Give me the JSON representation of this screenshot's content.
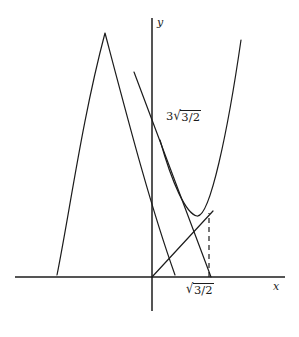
{
  "figure": {
    "background_color": "#ffffff",
    "ink_color": "#1c1c1c",
    "axes": {
      "x_axis_label": "x",
      "y_axis_label": "y",
      "x_axis": {
        "x1": 15,
        "y1": 277,
        "x2": 285,
        "y2": 277
      },
      "y_axis": {
        "x1": 152,
        "y1": 18,
        "x2": 152,
        "y2": 311
      },
      "origin": {
        "x": 152,
        "y": 277
      }
    },
    "labels": {
      "y_intercept": {
        "name": "3-root-three-halves",
        "coefficient": "3",
        "radical_sign": "√",
        "radicand": "3/2",
        "plain_text": "3√(3/2)"
      },
      "x_intercept": {
        "name": "root-three-halves",
        "coefficient": "",
        "radical_sign": "√",
        "radicand": "3/2",
        "plain_text": "√(3/2)"
      }
    }
  },
  "chart_data": {
    "type": "line",
    "xlabel": "x",
    "ylabel": "y",
    "grid": false,
    "legend": false,
    "annotations": [
      {
        "text": "3√(3/2)",
        "target": "y-axis intercept of the tangent line",
        "x_px": 166,
        "y_px": 110
      },
      {
        "text": "√(3/2)",
        "target": "x-axis intercept below the curve minimum",
        "x_px": 186,
        "y_px": 283
      }
    ],
    "series": [
      {
        "name": "downward-parabola-left",
        "type": "curve",
        "description": "Downward opening parabola rising from lower-left, peaking left of the y-axis and descending steeply across it",
        "path": "M 57,275 C 70,210 82,120 105,33 C 128,120 150,205 175,275",
        "peak_px": {
          "x": 105,
          "y": 33
        }
      },
      {
        "name": "upward-parabola-right",
        "type": "curve",
        "description": "Upward opening parabola with minimum near the dashed ordinate, rising steeply to the upper right",
        "path": "M 160,140 C 172,183 186,214 197,216 C 210,218 228,130 241,40",
        "vertex_px": {
          "x": 199,
          "y": 216
        }
      },
      {
        "name": "tangent-line",
        "type": "line",
        "description": "Straight line through the y-axis intercept descending to the x-axis intercept",
        "from_px": {
          "x": 134,
          "y": 72
        },
        "to_px": {
          "x": 211,
          "y": 277
        }
      },
      {
        "name": "chord-from-origin",
        "type": "line",
        "description": "Straight line from the origin rising to the right toward the curve minimum",
        "from_px": {
          "x": 152,
          "y": 277
        },
        "to_px": {
          "x": 213,
          "y": 211
        }
      },
      {
        "name": "dashed-ordinate",
        "type": "dashed-line",
        "description": "Vertical dashed segment from the x-axis intercept up to the curve minimum",
        "from_px": {
          "x": 209,
          "y": 277
        },
        "to_px": {
          "x": 209,
          "y": 213
        }
      }
    ]
  }
}
